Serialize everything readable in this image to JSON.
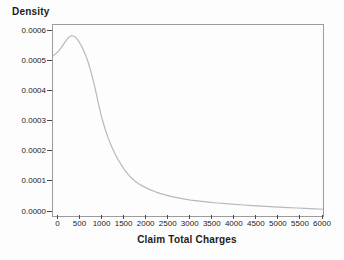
{
  "chart_data": {
    "type": "line",
    "title": "",
    "ylabel": "Density",
    "xlabel": "Claim Total Charges",
    "x_ticks": [
      0,
      500,
      1000,
      1500,
      2000,
      2500,
      3000,
      3500,
      4000,
      4500,
      5000,
      5500,
      6000
    ],
    "y_ticks": [
      "0.0000",
      "0.0001",
      "0.0002",
      "0.0003",
      "0.0004",
      "0.0005",
      "0.0006"
    ],
    "xlim": [
      -125,
      6000
    ],
    "ylim": [
      -1.33e-05,
      0.000623
    ],
    "grid": false,
    "legend": false,
    "frame_color": "#9c9c9c",
    "tick_color": "#4a4a4a",
    "text_color": "#1c1c1c",
    "curve_color": "#b9b9b9",
    "series": [
      {
        "name": "kernel-density-estimate",
        "points": [
          [
            -125,
            0.00052
          ],
          [
            -60,
            0.000528
          ],
          [
            0,
            0.000536
          ],
          [
            75,
            0.00055
          ],
          [
            150,
            0.000567
          ],
          [
            225,
            0.000581
          ],
          [
            300,
            0.000588
          ],
          [
            375,
            0.000584
          ],
          [
            450,
            0.000571
          ],
          [
            525,
            0.000552
          ],
          [
            600,
            0.000528
          ],
          [
            675,
            0.000498
          ],
          [
            750,
            0.00046
          ],
          [
            825,
            0.000415
          ],
          [
            900,
            0.000365
          ],
          [
            975,
            0.000318
          ],
          [
            1050,
            0.00028
          ],
          [
            1125,
            0.000247
          ],
          [
            1200,
            0.00022
          ],
          [
            1275,
            0.000196
          ],
          [
            1350,
            0.000175
          ],
          [
            1425,
            0.000157
          ],
          [
            1500,
            0.00014
          ],
          [
            1575,
            0.000126
          ],
          [
            1650,
            0.000114
          ],
          [
            1725,
            0.000104
          ],
          [
            1800,
            9.55e-05
          ],
          [
            1900,
            8.7e-05
          ],
          [
            2000,
            7.95e-05
          ],
          [
            2100,
            7.3e-05
          ],
          [
            2200,
            6.73e-05
          ],
          [
            2300,
            6.22e-05
          ],
          [
            2400,
            5.78e-05
          ],
          [
            2500,
            5.4e-05
          ],
          [
            2600,
            5.05e-05
          ],
          [
            2800,
            4.46e-05
          ],
          [
            3000,
            3.98e-05
          ],
          [
            3200,
            3.6e-05
          ],
          [
            3400,
            3.28e-05
          ],
          [
            3600,
            3e-05
          ],
          [
            3800,
            2.76e-05
          ],
          [
            4000,
            2.54e-05
          ],
          [
            4200,
            2.34e-05
          ],
          [
            4400,
            2.15e-05
          ],
          [
            4600,
            1.97e-05
          ],
          [
            4800,
            1.8e-05
          ],
          [
            5000,
            1.64e-05
          ],
          [
            5200,
            1.48e-05
          ],
          [
            5400,
            1.33e-05
          ],
          [
            5600,
            1.19e-05
          ],
          [
            5800,
            1.05e-05
          ],
          [
            6000,
            9.2e-06
          ]
        ]
      }
    ]
  }
}
